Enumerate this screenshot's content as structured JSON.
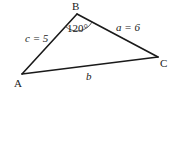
{
  "diagram": {
    "type": "triangle",
    "vertices": {
      "A": {
        "label": "A",
        "x": 22,
        "y": 74
      },
      "B": {
        "label": "B",
        "x": 77,
        "y": 14
      },
      "C": {
        "label": "C",
        "x": 158,
        "y": 57
      }
    },
    "sides": {
      "c": {
        "label": "c = 5",
        "from": "A",
        "to": "B"
      },
      "a": {
        "label": "a = 6",
        "from": "B",
        "to": "C"
      },
      "b": {
        "label": "b",
        "from": "A",
        "to": "C"
      }
    },
    "angle": {
      "vertex": "B",
      "label": "120°"
    },
    "colors": {
      "line": "#1a1a1a",
      "background": "#ffffff"
    }
  }
}
